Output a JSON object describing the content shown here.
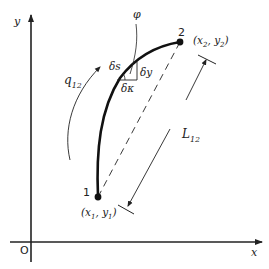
{
  "diagram": {
    "axes": {
      "x_label": "x",
      "y_label": "y",
      "origin_label": "O"
    },
    "points": [
      {
        "id": "1",
        "label": "1",
        "coords": "(x1, y1)",
        "coords_base": "(x",
        "sub1": "1",
        "mid": ", y",
        "sub2": "1",
        "close": ")"
      },
      {
        "id": "2",
        "label": "2",
        "coords": "(x2, y2)",
        "coords_base": "(x",
        "sub1": "2",
        "mid": ", y",
        "sub2": "2",
        "close": ")"
      }
    ],
    "curve": {
      "label": "q12",
      "label_base": "q",
      "label_sub": "12"
    },
    "chord": {
      "label": "L12",
      "label_base": "L",
      "label_sub": "12"
    },
    "angle": {
      "label": "φ"
    },
    "element": {
      "ds": "δs",
      "dx": "δκ",
      "dy": "δy"
    }
  }
}
